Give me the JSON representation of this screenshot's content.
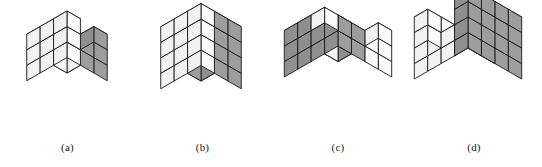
{
  "page": {
    "background_color": "#ffffff",
    "width": 542,
    "height": 167,
    "kind": "isometric-polycube-figure-row",
    "figure_count": 4
  },
  "style": {
    "stroke_color": "#1a1a1a",
    "stroke_width": 0.9,
    "face_top_white": "#ffffff",
    "face_left_white": "#f2f2f2",
    "face_right_white": "#fafafa",
    "face_top_gray": "#b0b0b0",
    "face_left_gray": "#8f8f8f",
    "face_right_gray": "#9d9d9d",
    "caption_color": "#1a1a1a",
    "caption_font_size": "11px"
  },
  "figures": [
    {
      "id": "figure-a",
      "caption": "(a)",
      "panel_left": 0,
      "panel_width": 135,
      "origin_x": 67,
      "origin_y": 104,
      "cube_size": 15.5,
      "dims": {
        "x": 3,
        "y": 3,
        "z": 3
      },
      "voxels": [
        {
          "x": 0,
          "y": 0,
          "z": 0,
          "shaded": false
        },
        {
          "x": 1,
          "y": 0,
          "z": 0,
          "shaded": false
        },
        {
          "x": 2,
          "y": 0,
          "z": 0,
          "shaded": true
        },
        {
          "x": 0,
          "y": 1,
          "z": 0,
          "shaded": false
        },
        {
          "x": 1,
          "y": 1,
          "z": 0,
          "shaded": true
        },
        {
          "x": 2,
          "y": 1,
          "z": 0,
          "shaded": true
        },
        {
          "x": 0,
          "y": 2,
          "z": 0,
          "shaded": false
        },
        {
          "x": 1,
          "y": 2,
          "z": 0,
          "shaded": false
        },
        {
          "x": 2,
          "y": 2,
          "z": 0,
          "shaded": false
        },
        {
          "x": 0,
          "y": 0,
          "z": 1,
          "shaded": false
        },
        {
          "x": 1,
          "y": 0,
          "z": 1,
          "shaded": false
        },
        {
          "x": 2,
          "y": 0,
          "z": 1,
          "shaded": true
        },
        {
          "x": 0,
          "y": 1,
          "z": 1,
          "shaded": false
        },
        {
          "x": 2,
          "y": 1,
          "z": 1,
          "shaded": true
        },
        {
          "x": 0,
          "y": 2,
          "z": 1,
          "shaded": false
        },
        {
          "x": 1,
          "y": 2,
          "z": 1,
          "shaded": false
        },
        {
          "x": 2,
          "y": 2,
          "z": 1,
          "shaded": false
        },
        {
          "x": 0,
          "y": 0,
          "z": 2,
          "shaded": false
        },
        {
          "x": 1,
          "y": 0,
          "z": 2,
          "shaded": true
        },
        {
          "x": 2,
          "y": 0,
          "z": 2,
          "shaded": true
        },
        {
          "x": 0,
          "y": 1,
          "z": 2,
          "shaded": false
        },
        {
          "x": 0,
          "y": 2,
          "z": 2,
          "shaded": false
        },
        {
          "x": 1,
          "y": 2,
          "z": 2,
          "shaded": false
        },
        {
          "x": 2,
          "y": 2,
          "z": 2,
          "shaded": false
        }
      ]
    },
    {
      "id": "figure-b",
      "caption": "(b)",
      "panel_left": 135,
      "panel_width": 135,
      "origin_x": 66,
      "origin_y": 112,
      "cube_size": 15.5,
      "dims": {
        "x": 3,
        "y": 3,
        "z": 4
      },
      "voxels": [
        {
          "x": 0,
          "y": 0,
          "z": 0,
          "shaded": false
        },
        {
          "x": 1,
          "y": 0,
          "z": 0,
          "shaded": false
        },
        {
          "x": 2,
          "y": 0,
          "z": 0,
          "shaded": true
        },
        {
          "x": 0,
          "y": 1,
          "z": 0,
          "shaded": false
        },
        {
          "x": 1,
          "y": 1,
          "z": 0,
          "shaded": true
        },
        {
          "x": 2,
          "y": 1,
          "z": 0,
          "shaded": true
        },
        {
          "x": 0,
          "y": 2,
          "z": 0,
          "shaded": false
        },
        {
          "x": 1,
          "y": 2,
          "z": 0,
          "shaded": false
        },
        {
          "x": 2,
          "y": 2,
          "z": 0,
          "shaded": false
        },
        {
          "x": 0,
          "y": 0,
          "z": 1,
          "shaded": false
        },
        {
          "x": 1,
          "y": 0,
          "z": 1,
          "shaded": true
        },
        {
          "x": 2,
          "y": 0,
          "z": 1,
          "shaded": true
        },
        {
          "x": 0,
          "y": 1,
          "z": 1,
          "shaded": true
        },
        {
          "x": 2,
          "y": 1,
          "z": 1,
          "shaded": true
        },
        {
          "x": 0,
          "y": 2,
          "z": 1,
          "shaded": false
        },
        {
          "x": 1,
          "y": 2,
          "z": 1,
          "shaded": false
        },
        {
          "x": 2,
          "y": 2,
          "z": 1,
          "shaded": false
        },
        {
          "x": 0,
          "y": 0,
          "z": 2,
          "shaded": false
        },
        {
          "x": 1,
          "y": 0,
          "z": 2,
          "shaded": true
        },
        {
          "x": 2,
          "y": 0,
          "z": 2,
          "shaded": true
        },
        {
          "x": 0,
          "y": 1,
          "z": 2,
          "shaded": true
        },
        {
          "x": 1,
          "y": 1,
          "z": 2,
          "shaded": false
        },
        {
          "x": 2,
          "y": 1,
          "z": 2,
          "shaded": true
        },
        {
          "x": 0,
          "y": 2,
          "z": 2,
          "shaded": false
        },
        {
          "x": 1,
          "y": 2,
          "z": 2,
          "shaded": false
        },
        {
          "x": 2,
          "y": 2,
          "z": 2,
          "shaded": false
        },
        {
          "x": 0,
          "y": 0,
          "z": 3,
          "shaded": false
        },
        {
          "x": 1,
          "y": 0,
          "z": 3,
          "shaded": false
        },
        {
          "x": 2,
          "y": 0,
          "z": 3,
          "shaded": true
        },
        {
          "x": 0,
          "y": 1,
          "z": 3,
          "shaded": false
        },
        {
          "x": 1,
          "y": 1,
          "z": 3,
          "shaded": false
        },
        {
          "x": 2,
          "y": 1,
          "z": 3,
          "shaded": true
        },
        {
          "x": 0,
          "y": 2,
          "z": 3,
          "shaded": false
        },
        {
          "x": 1,
          "y": 2,
          "z": 3,
          "shaded": false
        },
        {
          "x": 2,
          "y": 2,
          "z": 3,
          "shaded": false
        }
      ]
    },
    {
      "id": "figure-c",
      "caption": "(c)",
      "panel_left": 270,
      "panel_width": 136,
      "origin_x": 68,
      "origin_y": 108,
      "cube_size": 15.5,
      "dims": {
        "x": 4,
        "y": 4,
        "z": 3
      },
      "voxels": [
        {
          "x": 0,
          "y": 0,
          "z": 0,
          "shaded": true
        },
        {
          "x": 1,
          "y": 0,
          "z": 0,
          "shaded": false
        },
        {
          "x": 2,
          "y": 0,
          "z": 0,
          "shaded": false
        },
        {
          "x": 3,
          "y": 0,
          "z": 0,
          "shaded": false
        },
        {
          "x": 0,
          "y": 1,
          "z": 0,
          "shaded": true
        },
        {
          "x": 1,
          "y": 1,
          "z": 0,
          "shaded": false
        },
        {
          "x": 2,
          "y": 1,
          "z": 0,
          "shaded": false
        },
        {
          "x": 3,
          "y": 1,
          "z": 0,
          "shaded": false
        },
        {
          "x": 0,
          "y": 2,
          "z": 0,
          "shaded": true
        },
        {
          "x": 1,
          "y": 2,
          "z": 0,
          "shaded": true
        },
        {
          "x": 2,
          "y": 2,
          "z": 0,
          "shaded": true
        },
        {
          "x": 3,
          "y": 2,
          "z": 0,
          "shaded": true
        },
        {
          "x": 0,
          "y": 3,
          "z": 0,
          "shaded": true
        },
        {
          "x": 1,
          "y": 3,
          "z": 0,
          "shaded": true
        },
        {
          "x": 2,
          "y": 3,
          "z": 0,
          "shaded": true
        },
        {
          "x": 3,
          "y": 3,
          "z": 0,
          "shaded": true
        },
        {
          "x": 0,
          "y": 0,
          "z": 1,
          "shaded": false
        },
        {
          "x": 1,
          "y": 0,
          "z": 1,
          "shaded": false
        },
        {
          "x": 2,
          "y": 0,
          "z": 1,
          "shaded": false
        },
        {
          "x": 3,
          "y": 0,
          "z": 1,
          "shaded": false
        },
        {
          "x": 0,
          "y": 1,
          "z": 1,
          "shaded": true
        },
        {
          "x": 1,
          "y": 1,
          "z": 1,
          "shaded": false
        },
        {
          "x": 2,
          "y": 1,
          "z": 1,
          "shaded": false
        },
        {
          "x": 3,
          "y": 1,
          "z": 1,
          "shaded": false
        },
        {
          "x": 0,
          "y": 2,
          "z": 1,
          "shaded": true
        },
        {
          "x": 1,
          "y": 2,
          "z": 1,
          "shaded": true
        },
        {
          "x": 2,
          "y": 2,
          "z": 1,
          "shaded": true
        },
        {
          "x": 3,
          "y": 2,
          "z": 1,
          "shaded": true
        },
        {
          "x": 0,
          "y": 3,
          "z": 1,
          "shaded": true
        },
        {
          "x": 1,
          "y": 3,
          "z": 1,
          "shaded": true
        },
        {
          "x": 2,
          "y": 3,
          "z": 1,
          "shaded": true
        },
        {
          "x": 3,
          "y": 3,
          "z": 1,
          "shaded": true
        },
        {
          "x": 0,
          "y": 0,
          "z": 2,
          "shaded": false
        },
        {
          "x": 1,
          "y": 0,
          "z": 2,
          "shaded": true
        },
        {
          "x": 2,
          "y": 0,
          "z": 2,
          "shaded": true
        },
        {
          "x": 3,
          "y": 0,
          "z": 2,
          "shaded": false
        },
        {
          "x": 0,
          "y": 1,
          "z": 2,
          "shaded": false
        },
        {
          "x": 0,
          "y": 2,
          "z": 2,
          "shaded": true
        },
        {
          "x": 1,
          "y": 2,
          "z": 2,
          "shaded": true
        },
        {
          "x": 2,
          "y": 2,
          "z": 2,
          "shaded": false
        },
        {
          "x": 0,
          "y": 3,
          "z": 2,
          "shaded": true
        },
        {
          "x": 1,
          "y": 3,
          "z": 2,
          "shaded": true
        },
        {
          "x": 2,
          "y": 3,
          "z": 2,
          "shaded": false
        }
      ]
    },
    {
      "id": "figure-d",
      "caption": "(d)",
      "panel_left": 406,
      "panel_width": 136,
      "origin_x": 62,
      "origin_y": 110,
      "cube_size": 15.5,
      "dims": {
        "x": 4,
        "y": 4,
        "z": 4
      },
      "voxels": [
        {
          "x": 0,
          "y": 0,
          "z": 0,
          "shaded": false
        },
        {
          "x": 1,
          "y": 0,
          "z": 0,
          "shaded": false
        },
        {
          "x": 2,
          "y": 0,
          "z": 0,
          "shaded": false
        },
        {
          "x": 3,
          "y": 0,
          "z": 0,
          "shaded": true
        },
        {
          "x": 0,
          "y": 1,
          "z": 0,
          "shaded": false
        },
        {
          "x": 1,
          "y": 1,
          "z": 0,
          "shaded": false
        },
        {
          "x": 2,
          "y": 1,
          "z": 0,
          "shaded": false
        },
        {
          "x": 3,
          "y": 1,
          "z": 0,
          "shaded": true
        },
        {
          "x": 0,
          "y": 2,
          "z": 0,
          "shaded": false
        },
        {
          "x": 1,
          "y": 2,
          "z": 0,
          "shaded": false
        },
        {
          "x": 2,
          "y": 2,
          "z": 0,
          "shaded": false
        },
        {
          "x": 3,
          "y": 2,
          "z": 0,
          "shaded": true
        },
        {
          "x": 0,
          "y": 3,
          "z": 0,
          "shaded": false
        },
        {
          "x": 1,
          "y": 3,
          "z": 0,
          "shaded": false
        },
        {
          "x": 2,
          "y": 3,
          "z": 0,
          "shaded": false
        },
        {
          "x": 3,
          "y": 3,
          "z": 0,
          "shaded": true
        },
        {
          "x": 0,
          "y": 0,
          "z": 1,
          "shaded": false
        },
        {
          "x": 1,
          "y": 0,
          "z": 1,
          "shaded": false
        },
        {
          "x": 2,
          "y": 0,
          "z": 1,
          "shaded": false
        },
        {
          "x": 3,
          "y": 0,
          "z": 1,
          "shaded": true
        },
        {
          "x": 0,
          "y": 1,
          "z": 1,
          "shaded": false
        },
        {
          "x": 1,
          "y": 1,
          "z": 1,
          "shaded": false
        },
        {
          "x": 2,
          "y": 1,
          "z": 1,
          "shaded": true
        },
        {
          "x": 3,
          "y": 1,
          "z": 1,
          "shaded": true
        },
        {
          "x": 0,
          "y": 2,
          "z": 1,
          "shaded": false
        },
        {
          "x": 1,
          "y": 2,
          "z": 1,
          "shaded": false
        },
        {
          "x": 2,
          "y": 2,
          "z": 1,
          "shaded": false
        },
        {
          "x": 3,
          "y": 2,
          "z": 1,
          "shaded": true
        },
        {
          "x": 0,
          "y": 3,
          "z": 1,
          "shaded": false
        },
        {
          "x": 1,
          "y": 3,
          "z": 1,
          "shaded": false
        },
        {
          "x": 2,
          "y": 3,
          "z": 1,
          "shaded": false
        },
        {
          "x": 3,
          "y": 3,
          "z": 1,
          "shaded": true
        },
        {
          "x": 0,
          "y": 0,
          "z": 2,
          "shaded": false
        },
        {
          "x": 1,
          "y": 0,
          "z": 2,
          "shaded": false
        },
        {
          "x": 3,
          "y": 0,
          "z": 2,
          "shaded": true
        },
        {
          "x": 0,
          "y": 1,
          "z": 2,
          "shaded": false
        },
        {
          "x": 1,
          "y": 1,
          "z": 2,
          "shaded": true
        },
        {
          "x": 3,
          "y": 1,
          "z": 2,
          "shaded": true
        },
        {
          "x": 0,
          "y": 2,
          "z": 2,
          "shaded": false
        },
        {
          "x": 3,
          "y": 2,
          "z": 2,
          "shaded": true
        },
        {
          "x": 0,
          "y": 3,
          "z": 2,
          "shaded": false
        },
        {
          "x": 3,
          "y": 3,
          "z": 2,
          "shaded": true
        },
        {
          "x": 0,
          "y": 0,
          "z": 3,
          "shaded": true
        },
        {
          "x": 3,
          "y": 0,
          "z": 3,
          "shaded": true
        },
        {
          "x": 0,
          "y": 1,
          "z": 3,
          "shaded": false
        },
        {
          "x": 3,
          "y": 1,
          "z": 3,
          "shaded": true
        },
        {
          "x": 0,
          "y": 2,
          "z": 3,
          "shaded": false
        },
        {
          "x": 3,
          "y": 2,
          "z": 3,
          "shaded": true
        },
        {
          "x": 0,
          "y": 3,
          "z": 3,
          "shaded": false
        },
        {
          "x": 3,
          "y": 3,
          "z": 3,
          "shaded": true
        }
      ]
    }
  ]
}
